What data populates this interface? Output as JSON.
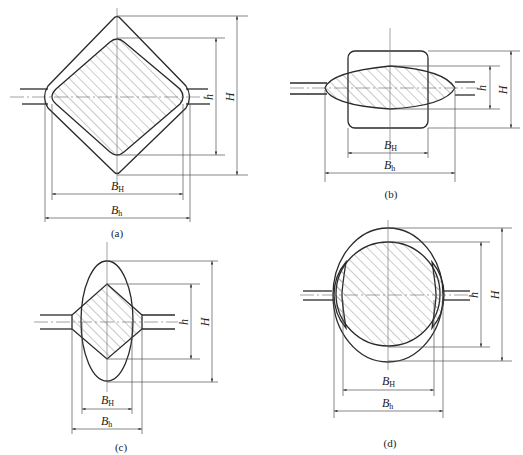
{
  "figure": {
    "panels": [
      {
        "id": "a",
        "caption": "(a)",
        "description": "Square (diamond) pass: outer diamond groove with hatched rounded diamond bar",
        "labels": {
          "H": "H",
          "h": "h",
          "BH_main": "B",
          "BH_sub": "H",
          "Bh_main": "B",
          "Bh_sub": "h"
        }
      },
      {
        "id": "b",
        "caption": "(b)",
        "description": "Rounded square bar entering flat oval groove (hatched oval)",
        "labels": {
          "H": "H",
          "h": "h",
          "BH_main": "B",
          "BH_sub": "H",
          "Bh_main": "B",
          "Bh_sub": "h"
        }
      },
      {
        "id": "c",
        "caption": "(c)",
        "description": "Vertical oval bar with hatched diamond groove",
        "labels": {
          "H": "H",
          "h": "h",
          "BH_main": "B",
          "BH_sub": "H",
          "Bh_main": "B",
          "Bh_sub": "h"
        }
      },
      {
        "id": "d",
        "caption": "(d)",
        "description": "Vertical oval bar with hatched round groove",
        "labels": {
          "H": "H",
          "h": "h",
          "BH_main": "B",
          "BH_sub": "H",
          "Bh_main": "B",
          "Bh_sub": "h"
        }
      }
    ]
  }
}
